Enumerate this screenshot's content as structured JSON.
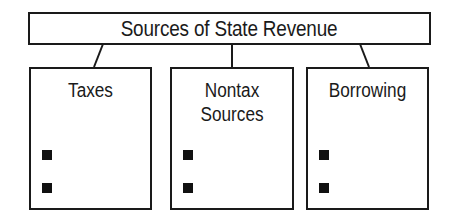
{
  "diagram": {
    "title": "Sources of State Revenue",
    "categories": [
      {
        "label": "Taxes",
        "bullets": [
          "",
          ""
        ]
      },
      {
        "label": "Nontax\nSources",
        "label_lines": [
          "Nontax",
          "Sources"
        ],
        "bullets": [
          "",
          ""
        ]
      },
      {
        "label": "Borrowing",
        "bullets": [
          "",
          ""
        ]
      }
    ],
    "colors": {
      "line": "#1a1a1a",
      "background": "#ffffff",
      "bullet": "#111111"
    },
    "bullet_icon": "square-bullet-icon"
  }
}
